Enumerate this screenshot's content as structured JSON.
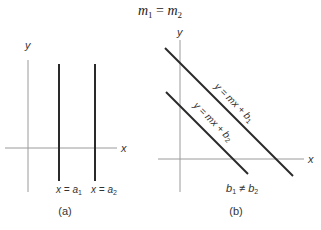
{
  "title": {
    "m1": "m",
    "sub1": "1",
    "eq": "=",
    "m2": "m",
    "sub2": "2"
  },
  "panel_a": {
    "y_label": "y",
    "x_label": "x",
    "line1_label": {
      "lhs": "x = a",
      "sub": "1"
    },
    "line2_label": {
      "lhs": "x = a",
      "sub": "2"
    },
    "caption": "(a)"
  },
  "panel_b": {
    "y_label": "y",
    "x_label": "x",
    "line1_label": {
      "lhs": "y = mx + b",
      "sub": "1"
    },
    "line2_label": {
      "lhs": "y = mx + b",
      "sub": "2"
    },
    "condition": {
      "b1": "b",
      "sub1": "1",
      "neq": "≠",
      "b2": "b",
      "sub2": "2"
    },
    "caption": "(b)"
  },
  "colors": {
    "axis": "#9a9a9a",
    "line": "#2a2a2a",
    "text": "#333333"
  }
}
